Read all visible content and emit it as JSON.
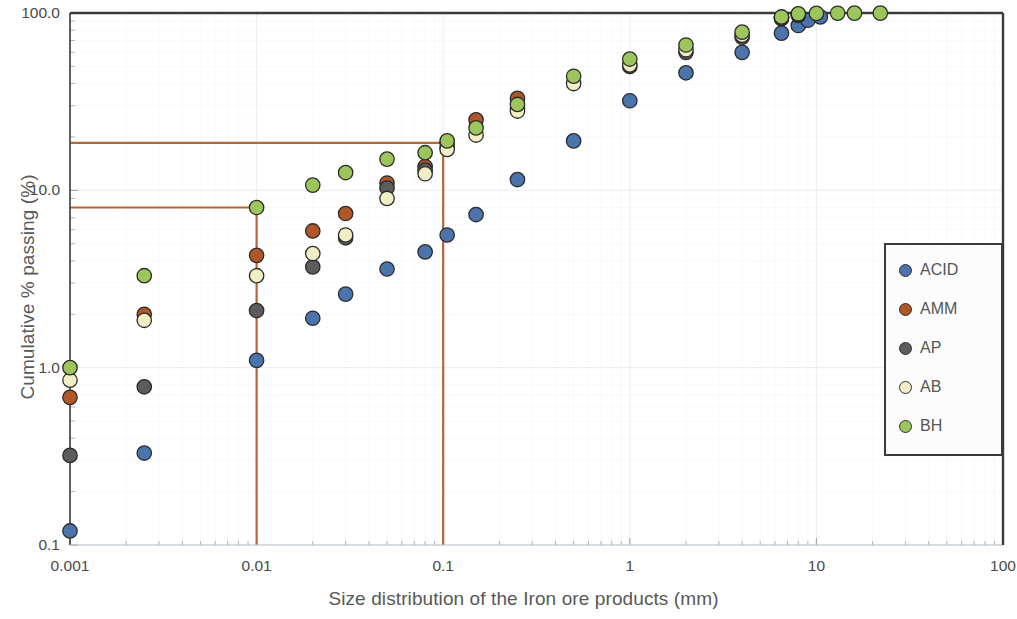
{
  "chart_data": {
    "type": "scatter",
    "title": "",
    "xlabel": "Size distribution of the Iron ore products (mm)",
    "ylabel": "Cumulative % passing (%)",
    "xscale": "log",
    "yscale": "log",
    "xlim": [
      0.001,
      100
    ],
    "ylim": [
      0.1,
      100
    ],
    "grid": true,
    "legend_position": "right",
    "xticks": [
      "0.001",
      "0.01",
      "0.1",
      "1",
      "10",
      "100"
    ],
    "xtick_values": [
      0.001,
      0.01,
      0.1,
      1,
      10,
      100
    ],
    "yticks": [
      "0.1",
      "1.0",
      "10.0",
      "100.0"
    ],
    "ytick_values": [
      0.1,
      1,
      10,
      100
    ],
    "colors": {
      "ACID": "#4a74ab",
      "AMM": "#b0572a",
      "AP": "#5c5c5c",
      "AB": "#f2eec4",
      "BH": "#9cc65c",
      "reference_line": "#b5653a",
      "frame": "#3a3a3a",
      "grid": "#e8eef2"
    },
    "series": [
      {
        "name": "ACID",
        "color": "#4a74ab",
        "points": [
          [
            0.001,
            0.12
          ],
          [
            0.0025,
            0.33
          ],
          [
            0.01,
            1.1
          ],
          [
            0.02,
            1.9
          ],
          [
            0.03,
            2.6
          ],
          [
            0.05,
            3.6
          ],
          [
            0.08,
            4.5
          ],
          [
            0.105,
            5.6
          ],
          [
            0.15,
            7.3
          ],
          [
            0.25,
            11.5
          ],
          [
            0.5,
            19.0
          ],
          [
            1.0,
            32.0
          ],
          [
            2.0,
            46.0
          ],
          [
            4.0,
            60.0
          ],
          [
            6.5,
            77.0
          ],
          [
            8.0,
            85.0
          ],
          [
            9.0,
            91.0
          ],
          [
            10.5,
            95.0
          ]
        ]
      },
      {
        "name": "AMM",
        "color": "#b0572a",
        "points": [
          [
            0.001,
            0.68
          ],
          [
            0.0025,
            2.0
          ],
          [
            0.01,
            4.3
          ],
          [
            0.02,
            5.9
          ],
          [
            0.03,
            7.4
          ],
          [
            0.05,
            11.0
          ],
          [
            0.08,
            13.6
          ],
          [
            0.105,
            18.5
          ],
          [
            0.15,
            25.0
          ],
          [
            0.25,
            33.0
          ]
        ]
      },
      {
        "name": "AP",
        "color": "#5c5c5c",
        "points": [
          [
            0.001,
            0.32
          ],
          [
            0.0025,
            0.78
          ],
          [
            0.01,
            2.1
          ],
          [
            0.02,
            3.7
          ],
          [
            0.03,
            5.4
          ],
          [
            0.05,
            10.3
          ],
          [
            0.08,
            13.0
          ],
          [
            0.105,
            17.5
          ],
          [
            0.25,
            29.0
          ],
          [
            1.0,
            50.0
          ],
          [
            2.0,
            60.0
          ],
          [
            4.0,
            73.0
          ],
          [
            6.5,
            93.0
          ],
          [
            8.0,
            97.0
          ]
        ]
      },
      {
        "name": "AB",
        "color": "#f2eec4",
        "points": [
          [
            0.001,
            0.85
          ],
          [
            0.0025,
            1.85
          ],
          [
            0.01,
            3.3
          ],
          [
            0.02,
            4.4
          ],
          [
            0.03,
            5.6
          ],
          [
            0.05,
            9.0
          ],
          [
            0.08,
            12.4
          ],
          [
            0.105,
            17.0
          ],
          [
            0.15,
            20.5
          ],
          [
            0.25,
            28.0
          ],
          [
            0.5,
            40.0
          ],
          [
            1.0,
            51.0
          ],
          [
            2.0,
            62.0
          ],
          [
            4.0,
            75.0
          ],
          [
            6.5,
            94.0
          ],
          [
            8.0,
            98.0
          ]
        ]
      },
      {
        "name": "BH",
        "color": "#9cc65c",
        "points": [
          [
            0.001,
            1.0
          ],
          [
            0.0025,
            3.3
          ],
          [
            0.01,
            8.0
          ],
          [
            0.02,
            10.7
          ],
          [
            0.03,
            12.6
          ],
          [
            0.05,
            15.0
          ],
          [
            0.08,
            16.3
          ],
          [
            0.105,
            19.0
          ],
          [
            0.15,
            22.5
          ],
          [
            0.25,
            30.5
          ],
          [
            0.5,
            44.0
          ],
          [
            1.0,
            55.0
          ],
          [
            2.0,
            66.0
          ],
          [
            4.0,
            78.0
          ],
          [
            6.5,
            95.0
          ],
          [
            8.0,
            99.0
          ],
          [
            10.0,
            99.5
          ],
          [
            13.0,
            99.7
          ],
          [
            16.0,
            99.8
          ],
          [
            22.0,
            99.9
          ]
        ]
      }
    ],
    "reference_lines": [
      {
        "name": "upper",
        "y": 18.5,
        "x_end": 0.1,
        "y_end": 0.1
      },
      {
        "name": "lower",
        "y": 8.0,
        "x_end": 0.01,
        "y_end": 0.1
      }
    ]
  },
  "legend": {
    "items": [
      {
        "label": "ACID",
        "color": "#4a74ab"
      },
      {
        "label": "AMM",
        "color": "#b0572a"
      },
      {
        "label": "AP",
        "color": "#5c5c5c"
      },
      {
        "label": "AB",
        "color": "#f2eec4"
      },
      {
        "label": "BH",
        "color": "#9cc65c"
      }
    ]
  }
}
